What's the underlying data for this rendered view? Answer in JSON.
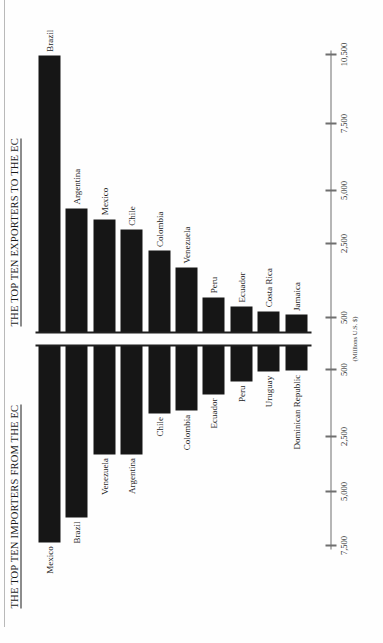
{
  "figure": {
    "units_label": "(Millions U.S. $)",
    "bar_color": "#161616",
    "axis_color": "#6f6f6f",
    "text_color": "#1a1a1a"
  },
  "chart_data": [
    {
      "type": "bar",
      "title": "THE TOP TEN EXPORTERS TO THE EC",
      "xlabel": "",
      "ylabel": "(Millions U.S. $)",
      "orientation": "vertical",
      "grid": false,
      "legend": "none",
      "ylim": [
        0,
        10500
      ],
      "tick_labels": [
        "500",
        "2,500",
        "5,000",
        "7,500",
        "10,500"
      ],
      "ticks": [
        500,
        2500,
        5000,
        7500,
        10500
      ],
      "categories": [
        "Brazil",
        "Argentina",
        "Mexico",
        "Chile",
        "Colombia",
        "Venezuela",
        "Peru",
        "Ecuador",
        "Costa Rica",
        "Jamaica"
      ],
      "values": [
        10450,
        4150,
        3650,
        3150,
        2300,
        1850,
        1050,
        800,
        670,
        570
      ]
    },
    {
      "type": "bar",
      "title": "THE TOP TEN IMPORTERS FROM THE EC",
      "xlabel": "",
      "ylabel": "(Millions U.S. $)",
      "orientation": "vertical",
      "grid": false,
      "legend": "none",
      "ylim": [
        0,
        7500
      ],
      "tick_labels": [
        "500",
        "2,500",
        "5,000",
        "7,500"
      ],
      "ticks": [
        500,
        2500,
        5000,
        7500
      ],
      "categories": [
        "Mexico",
        "Brazil",
        "Venezuela",
        "Argentina",
        "Chile",
        "Colombia",
        "Ecuador",
        "Peru",
        "Uruguay",
        "Dominican Republic"
      ],
      "values": [
        7350,
        6200,
        3300,
        3300,
        1800,
        1730,
        1250,
        860,
        570,
        540
      ]
    }
  ]
}
